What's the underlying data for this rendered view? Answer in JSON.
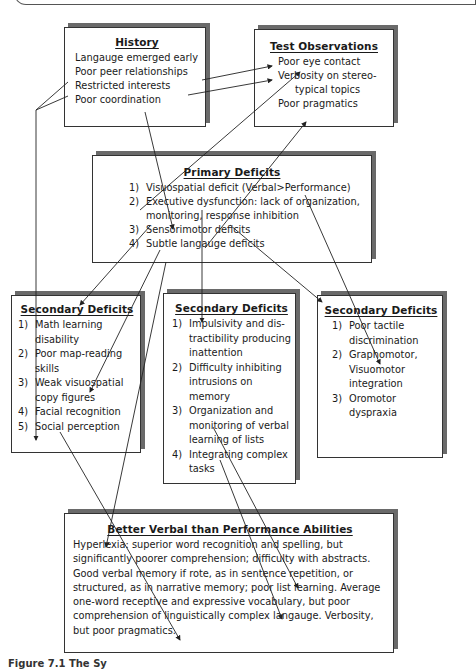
{
  "diagram": {
    "history": {
      "title": "History",
      "items": [
        "Langauge emerged early",
        "Poor peer relationships",
        "Restricted interests",
        "Poor coordination"
      ]
    },
    "test_observations": {
      "title": "Test Observations",
      "items": [
        "Poor eye contact",
        "Verbosity on stereo-",
        "typical topics",
        "Poor pragmatics"
      ]
    },
    "primary_deficits": {
      "title": "Primary Deficits",
      "items": [
        {
          "num": "1)",
          "text": "Visuospatial deficit (Verbal>Performance)"
        },
        {
          "num": "2)",
          "text": "Executive dysfunction: lack of organization, monitoring, response inhibition"
        },
        {
          "num": "3)",
          "text": "Sensorimotor deficits"
        },
        {
          "num": "4)",
          "text": "Subtle langauge deficits"
        }
      ]
    },
    "secondary_left": {
      "title": "Secondary Deficits",
      "items": [
        {
          "num": "1)",
          "text": "Math learning disability"
        },
        {
          "num": "2)",
          "text": "Poor map-reading skills"
        },
        {
          "num": "3)",
          "text": "Weak visuospatial copy figures"
        },
        {
          "num": "4)",
          "text": "Facial recognition"
        },
        {
          "num": "5)",
          "text": "Social perception"
        }
      ]
    },
    "secondary_middle": {
      "title": "Secondary Deficits",
      "items": [
        {
          "num": "1)",
          "text": "Impulsivity and dis-tractibility producing inattention"
        },
        {
          "num": "2)",
          "text": "Difficulty inhibiting intrusions on memory"
        },
        {
          "num": "3)",
          "text": "Organization and monitoring of verbal learning of lists"
        },
        {
          "num": "4)",
          "text": "Integrating complex tasks"
        }
      ]
    },
    "secondary_right": {
      "title": "Secondary Deficits",
      "items": [
        {
          "num": "1)",
          "text": "Poor tactile discrimination"
        },
        {
          "num": "2)",
          "text": "Graphomotor, Visuomotor integration"
        },
        {
          "num": "3)",
          "text": "Oromotor dyspraxia"
        }
      ]
    },
    "better_verbal": {
      "title": "Better Verbal than Performance Abilities",
      "text": "Hyperlexia: superior word recognition and spelling, but significantly poorer comprehension; difficulty with abstracts. Good verbal memory if rote, as in sentence repetition, or structured, as in narrative memory; poor list learning. Average one-word receptive and expressive vocabulary, but poor comprehension of linguistically complex langauge. Verbosity, but poor pragmatics."
    }
  },
  "caption": "Figure 7.1 The Sy"
}
